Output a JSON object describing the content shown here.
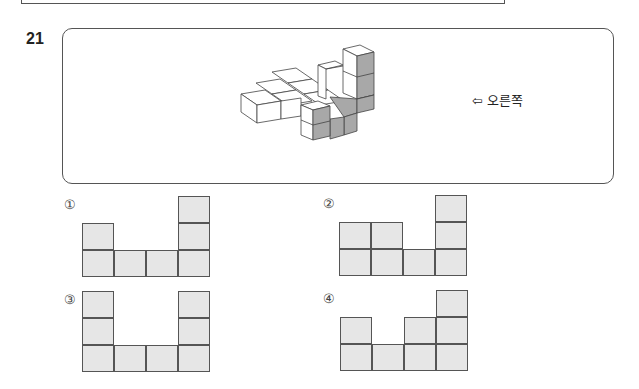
{
  "question": {
    "number": "21",
    "direction_label": "오른쪽",
    "direction_arrow": "⇦"
  },
  "options": [
    {
      "label": "①",
      "columns": [
        2,
        1,
        1,
        3
      ]
    },
    {
      "label": "②",
      "columns": [
        2,
        2,
        1,
        3
      ]
    },
    {
      "label": "③",
      "columns": [
        3,
        1,
        1,
        3
      ]
    },
    {
      "label": "④",
      "columns": [
        2,
        1,
        2,
        3
      ]
    }
  ],
  "colors": {
    "cell_fill": "#e6e6e6",
    "cell_border": "#555555",
    "shaded_face": "#a8a8a8"
  }
}
